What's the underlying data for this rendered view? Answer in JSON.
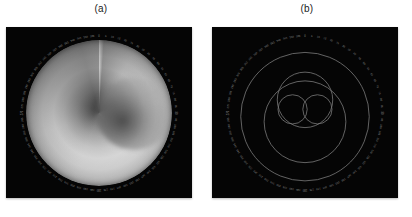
{
  "figure": {
    "background_color": "#ffffff",
    "panel_background_color": "#050505",
    "panels": [
      {
        "id": "a",
        "label": "(a)",
        "kind": "polar-intensity-map",
        "description": "grayscale spiral vortex intensity map with radial discontinuity at top"
      },
      {
        "id": "b",
        "label": "(b)",
        "kind": "polar-contour-plot",
        "description": "contour outlines: large oval, medium circle and two small lobes"
      }
    ]
  },
  "axis": {
    "type": "polar",
    "tick_count": 72,
    "tick_step_deg": 5,
    "tick_label_color": "#8d8d8d",
    "tick_labels": [
      "0",
      "5",
      "10",
      "15",
      "20",
      "25",
      "30",
      "35",
      "40",
      "45",
      "50",
      "55",
      "60",
      "65",
      "70",
      "75",
      "80",
      "85",
      "90",
      "95",
      "100",
      "105",
      "110",
      "115",
      "120",
      "125",
      "130",
      "135",
      "140",
      "145",
      "150",
      "155",
      "160",
      "165",
      "170",
      "175",
      "180",
      "185",
      "190",
      "195",
      "200",
      "205",
      "210",
      "215",
      "220",
      "225",
      "230",
      "235",
      "240",
      "245",
      "250",
      "255",
      "260",
      "265",
      "270",
      "275",
      "280",
      "285",
      "290",
      "295",
      "300",
      "305",
      "310",
      "315",
      "320",
      "325",
      "330",
      "335",
      "340",
      "345",
      "350",
      "355"
    ]
  },
  "chart_data": {
    "type": "heatmap",
    "title": "",
    "xlabel": "",
    "ylabel": "",
    "coordinate_system": "polar",
    "theta_range_deg": [
      0,
      360
    ],
    "r_range": [
      0,
      1
    ],
    "colormap": "grayscale",
    "panel_a": {
      "type": "heatmap",
      "title": "(a)",
      "series_name": "intensity",
      "theta_deg": [
        0,
        30,
        60,
        90,
        120,
        150,
        180,
        210,
        240,
        270,
        300,
        330,
        360
      ],
      "radial_profile_r": [
        0.0,
        0.1,
        0.2,
        0.3,
        0.4,
        0.5,
        0.6,
        0.7,
        0.8,
        0.9,
        1.0
      ],
      "radial_profile_intensity": [
        0.29,
        0.43,
        0.6,
        0.74,
        0.81,
        0.77,
        0.66,
        0.54,
        0.44,
        0.35,
        0.35
      ],
      "angular_modulation": [
        0.3,
        0.55,
        0.72,
        0.8,
        0.78,
        0.7,
        0.58,
        0.46,
        0.38,
        0.32,
        0.36,
        0.3,
        0.3
      ],
      "peak_intensity": 0.81,
      "min_intensity": 0.12,
      "discontinuity_theta_deg": 90,
      "singularity_center": [
        0.0,
        0.0
      ]
    },
    "panel_b": {
      "type": "line",
      "title": "(b)",
      "series": [
        {
          "name": "outer-contour",
          "center": [
            0.0,
            -0.05
          ],
          "radius": 0.88,
          "level": 0.2
        },
        {
          "name": "mid-oval",
          "center": [
            0.0,
            -0.12
          ],
          "radius": 0.56,
          "level": 0.4
        },
        {
          "name": "upper-circle",
          "center": [
            0.0,
            0.18
          ],
          "radius": 0.38,
          "level": 0.6
        },
        {
          "name": "left-lobe",
          "center": [
            -0.17,
            0.05
          ],
          "radius": 0.2,
          "level": 0.8
        },
        {
          "name": "right-lobe",
          "center": [
            0.17,
            0.05
          ],
          "radius": 0.2,
          "level": 0.8
        }
      ],
      "line_color": "#7a7a7a",
      "legend": "none",
      "grid": false
    }
  }
}
